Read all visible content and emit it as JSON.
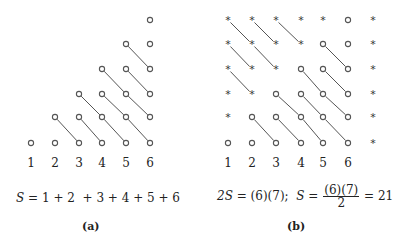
{
  "panel_a": {
    "caption": "(a)",
    "n": 6,
    "column_labels": [
      "1",
      "2",
      "3",
      "4",
      "5",
      "6"
    ],
    "equation": {
      "lhs": "S",
      "eq": "=",
      "rhs": "1 + 2  + 3 + 4 + 5 + 6"
    },
    "marker_circle": "o",
    "description": "Column k contains k circles stacked from the bottom; diagonal lines connect circles going down-right."
  },
  "panel_b": {
    "caption": "(b)",
    "n": 6,
    "columns": 7,
    "column_labels": [
      "1",
      "2",
      "3",
      "4",
      "5",
      "6"
    ],
    "equation": {
      "part1_lhs": "2S",
      "part1_eq": "=",
      "part1_rhs": "(6)(7);",
      "part2_lhs": "S",
      "part2_eq": "=",
      "frac_num": "(6)(7)",
      "frac_den": "2",
      "part2_eq2": "=",
      "result": "21"
    },
    "marker_circle": "o",
    "marker_star": "*",
    "description": "Circles form a lower-left staircase (column k has k circles); asterisks fill the complementary upper-right staircase forming a 6×7 rectangle."
  },
  "colors": {
    "stroke": "#555555",
    "text": "#222222",
    "background": "#ffffff"
  }
}
